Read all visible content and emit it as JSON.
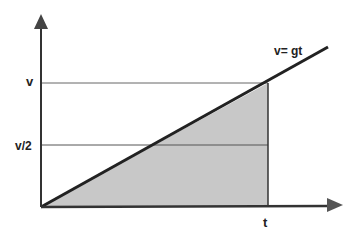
{
  "diagram": {
    "type": "velocity-time graph",
    "line_label": "v= gt",
    "y_labels": {
      "top": "v",
      "half": "v/2"
    },
    "x_labels": {
      "t": "t"
    },
    "colors": {
      "axis": "#333333",
      "fill": "#c8c8c8",
      "line": "#222222",
      "grid": "#555555"
    }
  }
}
